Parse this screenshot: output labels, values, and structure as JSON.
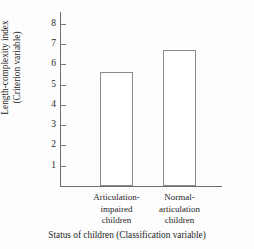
{
  "chart_data": {
    "type": "bar",
    "title": "",
    "categories": [
      "Articulation-impaired children",
      "Normal-articulation children"
    ],
    "category_lines": [
      [
        "Articulation-",
        "impaired",
        "children"
      ],
      [
        "Normal-",
        "articulation",
        "children"
      ]
    ],
    "values": [
      5.6,
      6.7
    ],
    "xlabel": "Status of children (Classification variable)",
    "ylabel": "Length-complexity index (Criterion variable)",
    "ylabel_lines": [
      "Length-complexity index",
      "(Criterion variable)"
    ],
    "ylim": [
      0,
      8.6
    ],
    "yticks": [
      8,
      7,
      6,
      5,
      4,
      3,
      2,
      1
    ],
    "ytick_labels": [
      "8",
      "7",
      "6",
      "5",
      "4",
      "3",
      "2",
      "1"
    ],
    "grid": false,
    "legend": false,
    "legend_position": "none",
    "bar_fill_color": "#ffffff",
    "bar_border_color": "#8a8a8a",
    "axis_color": "#6f6f6f",
    "text_color": "#1f1f1f",
    "background_color": "#fdfdfd"
  }
}
